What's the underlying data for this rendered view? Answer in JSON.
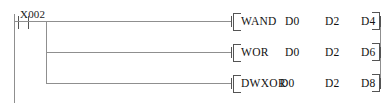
{
  "diagram": {
    "type": "plc-ladder-logic",
    "colors": {
      "wire": "#8f8f8f",
      "symbol": "#545454",
      "text": "#111111",
      "background": "#ffffff"
    },
    "left_rail_label": "",
    "contact": {
      "label": "X002",
      "kind": "normally-open"
    },
    "rungs": [
      {
        "instruction": "WAND",
        "operands": [
          "D0",
          "D2",
          "D4"
        ],
        "bracket_open": "[",
        "bracket_close": "]"
      },
      {
        "instruction": "WOR",
        "operands": [
          "D0",
          "D2",
          "D6"
        ],
        "bracket_open": "[",
        "bracket_close": "]"
      },
      {
        "instruction": "DWXOR",
        "operands": [
          "D0",
          "D2",
          "D8"
        ],
        "bracket_open": "[",
        "bracket_close": "]"
      }
    ]
  }
}
